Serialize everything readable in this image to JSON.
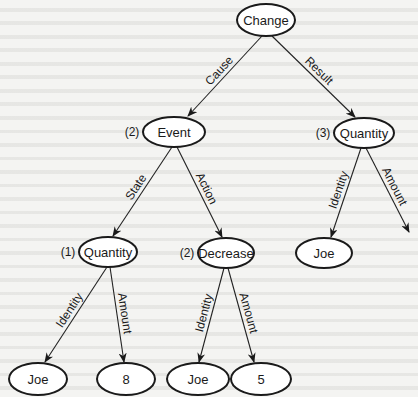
{
  "diagram": {
    "nodes": [
      {
        "id": "change",
        "label": "Change",
        "index": "",
        "cx": 266,
        "cy": 20,
        "rx": 29,
        "ry": 16
      },
      {
        "id": "event",
        "label": "Event",
        "index": "(2)",
        "cx": 174,
        "cy": 132,
        "rx": 31,
        "ry": 15
      },
      {
        "id": "quantity3",
        "label": "Quantity",
        "index": "(3)",
        "cx": 364,
        "cy": 133,
        "rx": 30,
        "ry": 15
      },
      {
        "id": "quantity1",
        "label": "Quantity",
        "index": "(1)",
        "cx": 108,
        "cy": 252,
        "rx": 29,
        "ry": 15
      },
      {
        "id": "decrease",
        "label": "Decrease",
        "index": "(2)",
        "cx": 226,
        "cy": 253,
        "rx": 28,
        "ry": 15
      },
      {
        "id": "joe_right",
        "label": "Joe",
        "index": "",
        "cx": 324,
        "cy": 253,
        "rx": 28,
        "ry": 15
      },
      {
        "id": "joe_1",
        "label": "Joe",
        "index": "",
        "cx": 38,
        "cy": 379,
        "rx": 29,
        "ry": 16
      },
      {
        "id": "eight",
        "label": "8",
        "index": "",
        "cx": 126,
        "cy": 379,
        "rx": 29,
        "ry": 16
      },
      {
        "id": "joe_2",
        "label": "Joe",
        "index": "",
        "cx": 198,
        "cy": 379,
        "rx": 31,
        "ry": 16
      },
      {
        "id": "five",
        "label": "5",
        "index": "",
        "cx": 261,
        "cy": 379,
        "rx": 30,
        "ry": 16
      }
    ],
    "edges": [
      {
        "from": "change",
        "to": "event",
        "label": "Cause",
        "x1": 262,
        "y1": 36,
        "x2": 188,
        "y2": 116
      },
      {
        "from": "change",
        "to": "quantity3",
        "label": "Result",
        "x1": 272,
        "y1": 36,
        "x2": 355,
        "y2": 117
      },
      {
        "from": "event",
        "to": "quantity1",
        "label": "State",
        "x1": 172,
        "y1": 147,
        "x2": 113,
        "y2": 236
      },
      {
        "from": "event",
        "to": "decrease",
        "label": "Action",
        "x1": 177,
        "y1": 147,
        "x2": 222,
        "y2": 237
      },
      {
        "from": "quantity3",
        "to": "joe_right",
        "label": "Identity",
        "x1": 361,
        "y1": 148,
        "x2": 331,
        "y2": 237
      },
      {
        "from": "quantity3",
        "to": "",
        "label": "Amount",
        "x1": 366,
        "y1": 148,
        "x2": 409,
        "y2": 232
      },
      {
        "from": "quantity1",
        "to": "joe_1",
        "label": "Identity",
        "x1": 107,
        "y1": 267,
        "x2": 45,
        "y2": 362
      },
      {
        "from": "quantity1",
        "to": "eight",
        "label": "Amount",
        "x1": 110,
        "y1": 267,
        "x2": 124,
        "y2": 362
      },
      {
        "from": "decrease",
        "to": "joe_2",
        "label": "Identity",
        "x1": 224,
        "y1": 268,
        "x2": 199,
        "y2": 362
      },
      {
        "from": "decrease",
        "to": "five",
        "label": "Amount",
        "x1": 228,
        "y1": 268,
        "x2": 254,
        "y2": 362
      }
    ]
  },
  "colors": {
    "background": "#f4f4f2",
    "stroke": "#1a1a1a",
    "node_fill": "#ffffff"
  }
}
